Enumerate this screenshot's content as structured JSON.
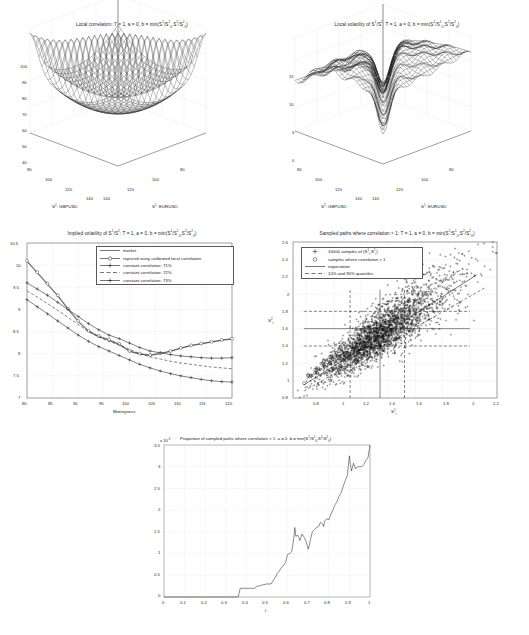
{
  "figure": {
    "kind": "multi-panel-matlab-figure",
    "panel_count": 5,
    "background": "#ffffff",
    "line_color": "#1a1a1a"
  },
  "chart_data": [
    {
      "id": "local-correlation-surface",
      "type": "surface",
      "title": "Local correlation: T = 1, a = 0, b = min(S1/S10,S2/S20)",
      "title_parts": [
        "Local correlation: T = 1, a = 0, b = min(S",
        "1",
        "/S",
        "1",
        "0",
        ",S",
        "2",
        "/S",
        "2",
        "0",
        ")"
      ],
      "xlabel": "S2: GBPUSD",
      "ylabel": "S1: EURUSD",
      "x_ticks": [
        80,
        100,
        120,
        140
      ],
      "y_ticks": [
        80,
        100,
        120,
        140
      ],
      "z_ticks": [
        40,
        50,
        60,
        70,
        80,
        90,
        100
      ],
      "zlim": [
        40,
        100
      ],
      "xlim": [
        80,
        140
      ],
      "ylim": [
        80,
        140
      ],
      "grid": true,
      "mesh": "wireframe",
      "description": "Saddle/funnel surface, high narrow ridge near the diagonal centre rising to 100, falling to about 40 at the near corner"
    },
    {
      "id": "local-volatility-surface",
      "type": "surface",
      "title": "Local volatility of S1/S2: T = 1, a = 0, b = min(S1/S10,S2/S20)",
      "xlabel": "S2: GBPUSD",
      "ylabel": "S1: EURUSD",
      "x_ticks": [
        80,
        100,
        120,
        140
      ],
      "y_ticks": [
        80,
        100,
        120,
        140
      ],
      "z_ticks": [
        0,
        5,
        10,
        15
      ],
      "zlim": [
        0,
        15
      ],
      "xlim": [
        80,
        140
      ],
      "ylim": [
        80,
        140
      ],
      "grid": true,
      "mesh": "wireframe",
      "description": "Rippled plateau around 10-12 with a trough dropping to about 2 along a diagonal band and a low shelf near 5-6 at the left edge"
    },
    {
      "id": "implied-volatility",
      "type": "line",
      "title": "Implied volatility of S1/S2: T = 1, a = 0, b = min(S1/S10,S2/S20)",
      "xlabel": "Moneyness",
      "ylabel": "",
      "x_ticks": [
        80,
        85,
        90,
        95,
        100,
        105,
        110,
        115,
        120
      ],
      "y_ticks": [
        7,
        7.5,
        8,
        8.5,
        9,
        9.5,
        10,
        10.5
      ],
      "xlim": [
        80,
        120
      ],
      "ylim": [
        7,
        10.5
      ],
      "grid": true,
      "legend_position": "top-right",
      "x": [
        80,
        82,
        84,
        86,
        88,
        90,
        92,
        94,
        96,
        98,
        100,
        102,
        104,
        106,
        108,
        110,
        112,
        114,
        116,
        118,
        120
      ],
      "series": [
        {
          "name": "market",
          "style": "solid",
          "marker": "none",
          "values": [
            10.08,
            9.82,
            9.56,
            9.3,
            9.0,
            8.72,
            8.5,
            8.38,
            8.3,
            8.2,
            8.05,
            7.99,
            7.96,
            8.0,
            8.05,
            8.12,
            8.18,
            8.22,
            8.26,
            8.3,
            8.33
          ]
        },
        {
          "name": "repriced using calibrated local correlation",
          "style": "solid",
          "marker": "circle",
          "values": [
            10.1,
            9.84,
            9.58,
            9.32,
            9.02,
            8.74,
            8.52,
            8.4,
            8.32,
            8.22,
            8.06,
            8.0,
            7.97,
            8.01,
            8.06,
            8.13,
            8.19,
            8.23,
            8.27,
            8.31,
            8.34
          ]
        },
        {
          "name": "constant correlation: 71%",
          "style": "solid",
          "marker": "plus",
          "values": [
            9.6,
            9.46,
            9.32,
            9.16,
            9.0,
            8.84,
            8.68,
            8.54,
            8.42,
            8.34,
            8.24,
            8.14,
            8.06,
            8.02,
            7.98,
            7.95,
            7.93,
            7.91,
            7.9,
            7.9,
            7.91
          ]
        },
        {
          "name": "constant correlation: 72%",
          "style": "dashed",
          "marker": "none",
          "values": [
            9.42,
            9.28,
            9.13,
            8.98,
            8.82,
            8.66,
            8.5,
            8.38,
            8.28,
            8.2,
            8.1,
            8.0,
            7.93,
            7.88,
            7.83,
            7.79,
            7.76,
            7.73,
            7.7,
            7.68,
            7.66
          ]
        },
        {
          "name": "constant correlation: 73%",
          "style": "solid",
          "marker": "plus",
          "values": [
            9.22,
            9.06,
            8.9,
            8.74,
            8.58,
            8.42,
            8.28,
            8.16,
            8.06,
            7.96,
            7.86,
            7.76,
            7.68,
            7.61,
            7.55,
            7.5,
            7.46,
            7.42,
            7.39,
            7.37,
            7.36
          ]
        }
      ]
    },
    {
      "id": "sampled-paths-scatter",
      "type": "scatter",
      "title": "Sampled paths where correlation > 1: T = 1, a = 0, b = min(S1/S10,S2/S20)",
      "xlabel": "S1t",
      "ylabel": "S2t",
      "x_ticks": [
        0.8,
        1,
        1.2,
        1.4,
        1.6,
        1.8,
        2,
        2.2
      ],
      "y_ticks": [
        0.8,
        1,
        1.2,
        1.4,
        1.6,
        1.8,
        2,
        2.2,
        2.4,
        2.6
      ],
      "xlim": [
        0.7,
        2.2
      ],
      "ylim": [
        0.8,
        2.6
      ],
      "grid": true,
      "legend_position": "top-left",
      "n_samples": 10000,
      "expectation_line": {
        "from": [
          0.78,
          0.95
        ],
        "to": [
          2.05,
          2.22
        ]
      },
      "quantile_lines": {
        "lower": {
          "from": [
            0.78,
            0.88
          ],
          "to": [
            2.12,
            2.08
          ]
        },
        "upper": {
          "from": [
            0.8,
            1.02
          ],
          "to": [
            1.95,
            2.3
          ]
        }
      },
      "marker_v_lines": [
        1.12,
        1.34,
        1.52
      ],
      "marker_h_lines": [
        1.4,
        1.6,
        1.8
      ],
      "cloud": {
        "center": [
          1.35,
          1.55
        ],
        "spread_x": 0.26,
        "spread_y": 0.28,
        "correlation": 0.86
      },
      "legend_entries": [
        {
          "label": "10000 samples of (S1t,S2t)",
          "marker": "plus"
        },
        {
          "label": "samples where correlation > 1",
          "marker": "circle"
        },
        {
          "label": "expectation",
          "marker": "line"
        },
        {
          "label": "10% and 90% quantiles",
          "marker": "dashed"
        }
      ]
    },
    {
      "id": "proportion-correlation-gt1",
      "type": "line",
      "title": "Proportion of sampled paths where correlation > 1, a = 0, b = min(S1/S10,S2/S20)",
      "exponent_label": "x 10-3",
      "xlabel": "t",
      "ylabel": "",
      "x_ticks": [
        0,
        0.1,
        0.2,
        0.3,
        0.4,
        0.5,
        0.6,
        0.7,
        0.8,
        0.9,
        1
      ],
      "y_ticks": [
        0,
        0.5,
        1,
        1.5,
        2,
        2.5,
        3,
        3.5
      ],
      "xlim": [
        0,
        1
      ],
      "ylim": [
        0,
        3.5
      ],
      "grid": true,
      "x": [
        0,
        0.05,
        0.1,
        0.15,
        0.2,
        0.25,
        0.3,
        0.34,
        0.36,
        0.37,
        0.38,
        0.4,
        0.42,
        0.44,
        0.45,
        0.46,
        0.48,
        0.5,
        0.52,
        0.54,
        0.55,
        0.56,
        0.57,
        0.58,
        0.59,
        0.6,
        0.61,
        0.62,
        0.63,
        0.635,
        0.64,
        0.65,
        0.66,
        0.67,
        0.68,
        0.69,
        0.7,
        0.705,
        0.71,
        0.72,
        0.73,
        0.74,
        0.75,
        0.76,
        0.77,
        0.775,
        0.78,
        0.79,
        0.8,
        0.81,
        0.82,
        0.83,
        0.84,
        0.85,
        0.86,
        0.87,
        0.88,
        0.89,
        0.9,
        0.905,
        0.91,
        0.92,
        0.93,
        0.94,
        0.95,
        0.96,
        0.97,
        0.98,
        0.99,
        1
      ],
      "values": [
        0,
        0,
        0,
        0,
        0,
        0,
        0,
        0,
        0,
        0.2,
        0.2,
        0.2,
        0.2,
        0.2,
        0.25,
        0.25,
        0.28,
        0.3,
        0.3,
        0.45,
        0.55,
        0.6,
        0.68,
        0.72,
        0.8,
        0.98,
        1.0,
        1.05,
        1.35,
        1.6,
        1.4,
        1.42,
        1.3,
        1.45,
        1.38,
        1.28,
        1.1,
        1.18,
        1.3,
        1.5,
        1.55,
        1.6,
        1.62,
        1.72,
        1.68,
        1.62,
        1.75,
        1.8,
        1.78,
        1.9,
        2.0,
        2.12,
        2.2,
        2.32,
        2.4,
        2.55,
        2.68,
        2.8,
        3.25,
        3.05,
        2.9,
        3.08,
        2.95,
        3.0,
        3.0,
        3.0,
        3.05,
        3.15,
        3.2,
        3.5
      ],
      "description": "Step-like monotone increasing proportion, flat at zero until t=0.37, then rising with noisy plateaus to 3.5e-3 at t=1"
    }
  ]
}
